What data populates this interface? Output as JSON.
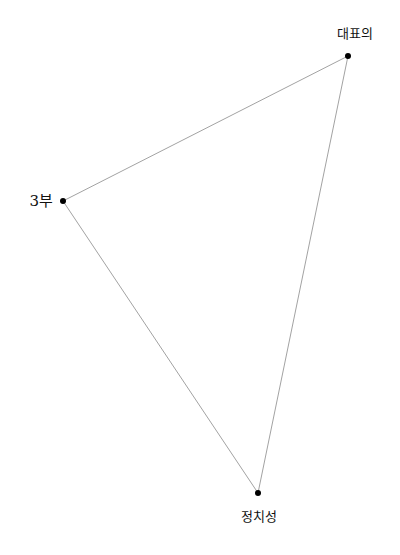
{
  "diagram": {
    "type": "triangle",
    "line_color": "#8a8a8a",
    "dot_color": "#000000",
    "nodes": [
      {
        "id": "top",
        "label": "대표의",
        "x": 348,
        "y": 56
      },
      {
        "id": "left",
        "label": "3부",
        "x": 63,
        "y": 201
      },
      {
        "id": "bottom",
        "label": "정치성",
        "x": 258,
        "y": 493
      }
    ],
    "edges": [
      [
        "top",
        "left"
      ],
      [
        "left",
        "bottom"
      ],
      [
        "bottom",
        "top"
      ]
    ]
  }
}
